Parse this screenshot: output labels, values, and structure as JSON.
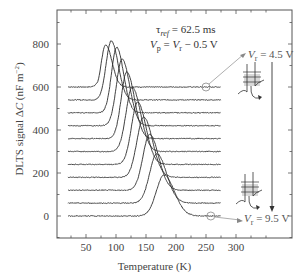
{
  "chart_data": {
    "type": "line",
    "title": "",
    "xlabel": "Temperature (K)",
    "ylabel": "DLTS signal ΔC (nF m⁻²)",
    "xlim": [
      20,
      355
    ],
    "ylim": [
      -100,
      940
    ],
    "x_ticks": [
      50,
      100,
      150,
      200,
      250,
      300
    ],
    "y_ticks": [
      0,
      200,
      400,
      600,
      800
    ],
    "grid": false,
    "legend": null,
    "annotations": [
      {
        "text": "τref = 62.5 ms",
        "position": "upper middle"
      },
      {
        "text": "Vp = Vr − 0.5 V",
        "position": "upper middle"
      },
      {
        "text": "Vr = 4.5 V",
        "position": "upper right",
        "points_to": "top curve at T≈250K"
      },
      {
        "text": "Vr = 9.5 V",
        "position": "lower right",
        "points_to": "bottom curve at T≈250K"
      }
    ],
    "note": "Curves are vertically offset by 60 nF m⁻² each; baseline offsets listed per series. Peak values are estimated readings (absolute, including offset).",
    "series": [
      {
        "name": "Vr = 4.5 V",
        "offset": 600,
        "peak_T": 83,
        "peak_value": 795,
        "width_K": 9
      },
      {
        "name": "Vr = 5.0 V",
        "offset": 540,
        "peak_T": 92,
        "peak_value": 815,
        "width_K": 10
      },
      {
        "name": "Vr = 5.5 V",
        "offset": 480,
        "peak_T": 101,
        "peak_value": 785,
        "width_K": 10
      },
      {
        "name": "Vr = 6.0 V",
        "offset": 420,
        "peak_T": 110,
        "peak_value": 730,
        "width_K": 11
      },
      {
        "name": "Vr = 6.5 V",
        "offset": 360,
        "peak_T": 118,
        "peak_value": 670,
        "width_K": 11
      },
      {
        "name": "Vr = 7.0 V",
        "offset": 300,
        "peak_T": 127,
        "peak_value": 600,
        "width_K": 12
      },
      {
        "name": "Vr = 7.5 V",
        "offset": 240,
        "peak_T": 136,
        "peak_value": 530,
        "width_K": 12
      },
      {
        "name": "Vr = 8.0 V",
        "offset": 180,
        "peak_T": 146,
        "peak_value": 460,
        "width_K": 13
      },
      {
        "name": "Vr = 8.5 V",
        "offset": 120,
        "peak_T": 156,
        "peak_value": 380,
        "width_K": 13
      },
      {
        "name": "Vr = 9.0 V",
        "offset": 60,
        "peak_T": 168,
        "peak_value": 290,
        "width_K": 14
      },
      {
        "name": "Vr = 9.5 V",
        "offset": 0,
        "peak_T": 180,
        "peak_value": 190,
        "width_K": 15
      }
    ],
    "x_range_data": [
      20,
      275
    ]
  },
  "labels": {
    "tau": "τ",
    "tau_sub": "ref",
    "tau_val": " = 62.5 ms",
    "vp_V": "V",
    "vp_sub": "p",
    "vp_eq": " = ",
    "vp_V2": "V",
    "vp_sub2": "r",
    "vp_rest": " − 0.5 V",
    "vr_top_V": "V",
    "vr_top_sub": "r",
    "vr_top_val": " = 4.5 V",
    "vr_bot_V": "V",
    "vr_bot_sub": "r",
    "vr_bot_val": " = 9.5 V"
  },
  "colors": {
    "curve": "#2b2b2b",
    "axis": "#555555",
    "annot_line": "#999999",
    "band_fill": "#c8c8c8"
  }
}
